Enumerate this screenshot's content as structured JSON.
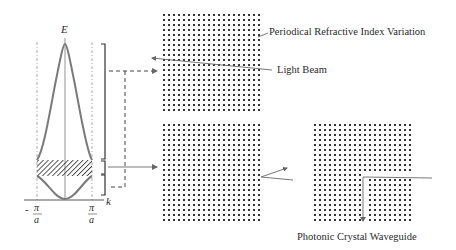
{
  "diagram": {
    "band_diagram": {
      "y_axis_label": "E",
      "x_axis_label": "k",
      "left_tick": {
        "sign": "-",
        "numerator": "π",
        "denominator": "a"
      },
      "right_tick": {
        "sign": "",
        "numerator": "π",
        "denominator": "a"
      },
      "elements": [
        "upper band (peak curve)",
        "band gap (hatched)",
        "lower band (parabola)"
      ]
    },
    "labels": {
      "periodic_index": "Periodical Refractive Index Variation",
      "light_beam": "Light Beam",
      "waveguide": "Photonic Crystal Waveguide"
    },
    "panels": [
      {
        "name": "transmission-lattice",
        "rows": 20,
        "cols": 20
      },
      {
        "name": "bandgap-reflection-lattice",
        "rows": 20,
        "cols": 20
      },
      {
        "name": "waveguide-lattice",
        "rows": 20,
        "cols": 20,
        "defect": "L-shaped waveguide"
      }
    ],
    "colors": {
      "curve": "#7a7a7a",
      "lines": "#555555",
      "dots": "#333333",
      "text": "#2a2a2a"
    }
  }
}
